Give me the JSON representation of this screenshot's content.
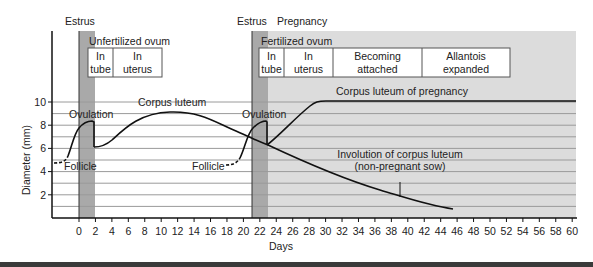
{
  "chart_data": {
    "type": "line",
    "title": "",
    "xlabel": "Days",
    "ylabel": "Diameter (mm)",
    "xlim": [
      -4,
      61
    ],
    "ylim": [
      0,
      12
    ],
    "x_ticks": [
      0,
      2,
      4,
      6,
      8,
      10,
      12,
      14,
      16,
      18,
      20,
      22,
      24,
      26,
      28,
      30,
      32,
      34,
      36,
      38,
      40,
      42,
      44,
      46,
      48,
      50,
      52,
      54,
      56,
      58,
      60
    ],
    "y_ticks": [
      2,
      4,
      6,
      8,
      10
    ],
    "grid": "horizontal every 1 mm",
    "regions": [
      {
        "name": "Estrus",
        "x": [
          0,
          2
        ],
        "shade": "dark"
      },
      {
        "name": "Estrus",
        "x": [
          21,
          23
        ],
        "shade": "dark"
      },
      {
        "name": "Pregnancy",
        "x": [
          23,
          61
        ],
        "shade": "light"
      }
    ],
    "series": [
      {
        "name": "Follicle (cycle 1)",
        "style": "dashed",
        "x": [
          -3.5,
          -2,
          -1,
          0
        ],
        "y": [
          4.7,
          5.0,
          6.0,
          7.4
        ]
      },
      {
        "name": "Follicle to ovulation (cycle 1)",
        "x": [
          0,
          1,
          2,
          2
        ],
        "y": [
          7.4,
          8.2,
          8.3,
          6.2
        ]
      },
      {
        "name": "Corpus luteum",
        "x": [
          2,
          4,
          7,
          11,
          14,
          17,
          20,
          23
        ],
        "y": [
          6.2,
          6.6,
          8.2,
          9.1,
          8.9,
          8.0,
          7.0,
          6.3
        ]
      },
      {
        "name": "Follicle (cycle 2)",
        "style": "dashed",
        "x": [
          18,
          19.5,
          21
        ],
        "y": [
          4.7,
          5.2,
          6.9
        ]
      },
      {
        "name": "Follicle to ovulation (cycle 2)",
        "x": [
          21,
          22,
          23,
          23
        ],
        "y": [
          6.9,
          8.2,
          8.3,
          6.3
        ]
      },
      {
        "name": "Corpus luteum of pregnancy",
        "x": [
          23,
          26,
          29,
          31,
          40,
          61
        ],
        "y": [
          6.3,
          7.8,
          9.4,
          10.1,
          10.1,
          10.1
        ]
      },
      {
        "name": "Involution of corpus luteum (non-pregnant sow)",
        "x": [
          16,
          23,
          30,
          36,
          40,
          44,
          46
        ],
        "y": [
          8.0,
          6.4,
          4.6,
          3.1,
          2.0,
          1.2,
          0.8
        ]
      }
    ],
    "annotations": [
      "Estrus",
      "Estrus",
      "Pregnancy",
      "Unfertilized ovum",
      "In tube",
      "In uterus",
      "Fertilized ovum",
      "In tube",
      "In uterus",
      "Becoming attached",
      "Allantois expanded",
      "Ovulation",
      "Ovulation",
      "Corpus luteum",
      "Corpus luteum of pregnancy",
      "Follicle",
      "Follicle",
      "Involution of corpus luteum (non-pregnant sow)"
    ]
  },
  "labels": {
    "estrus1": "Estrus",
    "estrus2": "Estrus",
    "pregnancy": "Pregnancy",
    "unfertilized": "Unfertilized ovum",
    "fertilized": "Fertilized ovum",
    "in": "In",
    "tube": "tube",
    "uterus": "uterus",
    "becoming": "Becoming",
    "attached": "attached",
    "allantois": "Allantois",
    "expanded": "expanded",
    "ovulation1": "Ovulation",
    "ovulation2": "Ovulation",
    "corpus_luteum": "Corpus luteum",
    "cl_pregnancy": "Corpus luteum of pregnancy",
    "follicle1": "Follicle",
    "follicle2": "Follicle",
    "involution1": "Involution of corpus luteum",
    "involution2": "(non-pregnant sow)",
    "xlabel": "Days",
    "ylabel": "Diameter (mm)"
  },
  "ticks": {
    "y": [
      "2",
      "4",
      "6",
      "8",
      "10"
    ],
    "x": [
      "0",
      "2",
      "4",
      "6",
      "8",
      "10",
      "12",
      "14",
      "16",
      "18",
      "20",
      "22",
      "24",
      "26",
      "28",
      "30",
      "32",
      "34",
      "36",
      "38",
      "40",
      "42",
      "44",
      "46",
      "48",
      "50",
      "52",
      "54",
      "56",
      "58",
      "60"
    ]
  }
}
